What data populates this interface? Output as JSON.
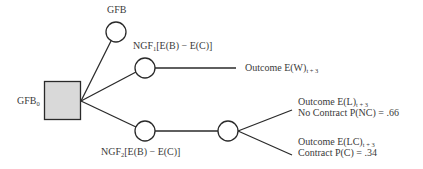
{
  "diagram": {
    "type": "decision-tree",
    "colors": {
      "line": "#2a2a2a",
      "decision_fill": "#d9d9d9",
      "node_fill": "#ffffff",
      "text": "#3a3a3a"
    },
    "root": {
      "label": "GFB",
      "label_sub": "0",
      "shape": "square"
    },
    "nodes": {
      "gfb": {
        "label": "GFB"
      },
      "ngf1": {
        "prefix": "NGF",
        "sub": "1",
        "suffix": "[E(B) − E(C)]"
      },
      "ngf2": {
        "prefix": "NGF",
        "sub": "2",
        "suffix": "[E(B) − E(C)]"
      }
    },
    "outcomes": {
      "w": {
        "text": "Outcome E(W)",
        "sub": "t + 3"
      },
      "l": {
        "text": "Outcome E(L)",
        "sub": "t + 3",
        "line2": "No Contract P(NC) = .66"
      },
      "lc": {
        "text": "Outcome E(LC)",
        "sub": "t + 3",
        "line2": "Contract P(C) = .34"
      }
    }
  }
}
